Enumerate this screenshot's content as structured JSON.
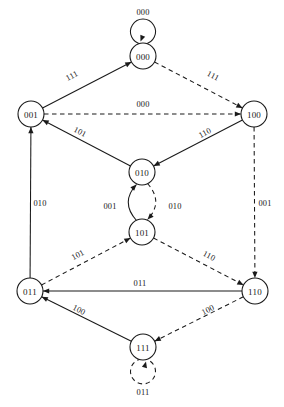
{
  "diagram": {
    "type": "state-transition-diagram",
    "title": "",
    "width": 284,
    "height": 407,
    "background_color": "#ffffff",
    "stroke_color": "#1a1a1a",
    "node_radius": 13,
    "nodes": [
      {
        "id": "000",
        "label": "000",
        "x": 143,
        "y": 56
      },
      {
        "id": "001",
        "label": "001",
        "x": 31,
        "y": 114
      },
      {
        "id": "100",
        "label": "100",
        "x": 254,
        "y": 114
      },
      {
        "id": "010",
        "label": "010",
        "x": 142,
        "y": 172
      },
      {
        "id": "101",
        "label": "101",
        "x": 142,
        "y": 232
      },
      {
        "id": "011",
        "label": "011",
        "x": 30,
        "y": 291
      },
      {
        "id": "110",
        "label": "110",
        "x": 255,
        "y": 291
      },
      {
        "id": "111",
        "label": "111",
        "x": 143,
        "y": 347
      }
    ],
    "edges": [
      {
        "from": "000",
        "to": "000",
        "label": "000",
        "style": "solid",
        "kind": "self-loop",
        "loop_side": "top",
        "label_x": 143,
        "label_y": 12
      },
      {
        "from": "001",
        "to": "000",
        "label": "111",
        "style": "solid",
        "kind": "line",
        "label_x": 72,
        "label_y": 76
      },
      {
        "from": "000",
        "to": "100",
        "label": "111",
        "style": "dashed",
        "kind": "line",
        "label_x": 213,
        "label_y": 76
      },
      {
        "from": "001",
        "to": "100",
        "label": "000",
        "style": "dashed",
        "kind": "line",
        "label_x": 143,
        "label_y": 104
      },
      {
        "from": "010",
        "to": "001",
        "label": "101",
        "style": "solid",
        "kind": "line",
        "label_x": 80,
        "label_y": 132
      },
      {
        "from": "100",
        "to": "010",
        "label": "110",
        "style": "solid",
        "kind": "line",
        "label_x": 205,
        "label_y": 133
      },
      {
        "from": "101",
        "to": "010",
        "label": "001",
        "style": "solid",
        "kind": "arc",
        "label_x": 110,
        "label_y": 206
      },
      {
        "from": "010",
        "to": "101",
        "label": "010",
        "style": "dashed",
        "kind": "arc",
        "label_x": 175,
        "label_y": 206
      },
      {
        "from": "011",
        "to": "001",
        "label": "010",
        "style": "solid",
        "kind": "line",
        "label_x": 40,
        "label_y": 203
      },
      {
        "from": "100",
        "to": "110",
        "label": "001",
        "style": "dashed",
        "kind": "line",
        "label_x": 265,
        "label_y": 203
      },
      {
        "from": "011",
        "to": "101",
        "label": "101",
        "style": "dashed",
        "kind": "line",
        "label_x": 78,
        "label_y": 255
      },
      {
        "from": "101",
        "to": "110",
        "label": "110",
        "style": "dashed",
        "kind": "line",
        "label_x": 209,
        "label_y": 256
      },
      {
        "from": "110",
        "to": "011",
        "label": "011",
        "style": "solid",
        "kind": "line",
        "label_x": 140,
        "label_y": 283
      },
      {
        "from": "111",
        "to": "011",
        "label": "100",
        "style": "solid",
        "kind": "line",
        "label_x": 79,
        "label_y": 310
      },
      {
        "from": "110",
        "to": "111",
        "label": "100",
        "style": "dashed",
        "kind": "line",
        "label_x": 208,
        "label_y": 310
      },
      {
        "from": "111",
        "to": "111",
        "label": "011",
        "style": "dashed",
        "kind": "self-loop",
        "loop_side": "bottom",
        "label_x": 143,
        "label_y": 392
      }
    ]
  }
}
